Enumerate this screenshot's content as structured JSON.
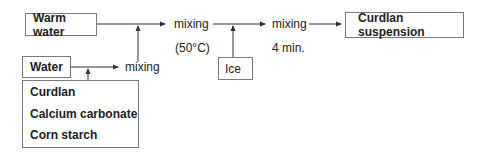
{
  "diagram": {
    "inputs": {
      "warm_water": "Warm water",
      "water": "Water",
      "ice": "Ice",
      "dry_ingredients": [
        "Curdlan",
        "Calcium carbonate",
        "Corn starch"
      ]
    },
    "steps": {
      "mixing_1": {
        "label": "mixing"
      },
      "mixing_2": {
        "label": "mixing",
        "condition": "(50°C)"
      },
      "mixing_3": {
        "label": "mixing",
        "condition": "4 min."
      }
    },
    "output": "Curdlan suspension",
    "colors": {
      "line": "#333333",
      "box_border": "#7a7a7a"
    }
  }
}
